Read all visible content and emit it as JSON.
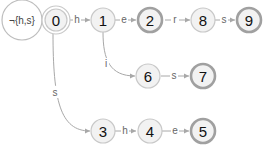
{
  "diagram": {
    "type": "finite-state-automaton",
    "colors": {
      "node_fill": "#f2f2f2",
      "node_stroke": "#c8c8c8",
      "accept_stroke": "#a0a0a0",
      "edge": "#a8a8a8",
      "label": "#666666"
    },
    "start_node": "0",
    "nodes": [
      {
        "id": "0",
        "label": "0",
        "accepting": false,
        "start": true
      },
      {
        "id": "1",
        "label": "1",
        "accepting": false
      },
      {
        "id": "2",
        "label": "2",
        "accepting": true
      },
      {
        "id": "8",
        "label": "8",
        "accepting": false
      },
      {
        "id": "9",
        "label": "9",
        "accepting": true
      },
      {
        "id": "6",
        "label": "6",
        "accepting": false
      },
      {
        "id": "7",
        "label": "7",
        "accepting": true
      },
      {
        "id": "3",
        "label": "3",
        "accepting": false
      },
      {
        "id": "4",
        "label": "4",
        "accepting": false
      },
      {
        "id": "5",
        "label": "5",
        "accepting": true
      }
    ],
    "edges": [
      {
        "from": "0",
        "to": "0",
        "label": "¬{h,s}"
      },
      {
        "from": "0",
        "to": "1",
        "label": "h"
      },
      {
        "from": "1",
        "to": "2",
        "label": "e"
      },
      {
        "from": "2",
        "to": "8",
        "label": "r"
      },
      {
        "from": "8",
        "to": "9",
        "label": "s"
      },
      {
        "from": "1",
        "to": "6",
        "label": "i"
      },
      {
        "from": "6",
        "to": "7",
        "label": "s"
      },
      {
        "from": "0",
        "to": "3",
        "label": "s"
      },
      {
        "from": "3",
        "to": "4",
        "label": "h"
      },
      {
        "from": "4",
        "to": "5",
        "label": "e"
      }
    ]
  }
}
